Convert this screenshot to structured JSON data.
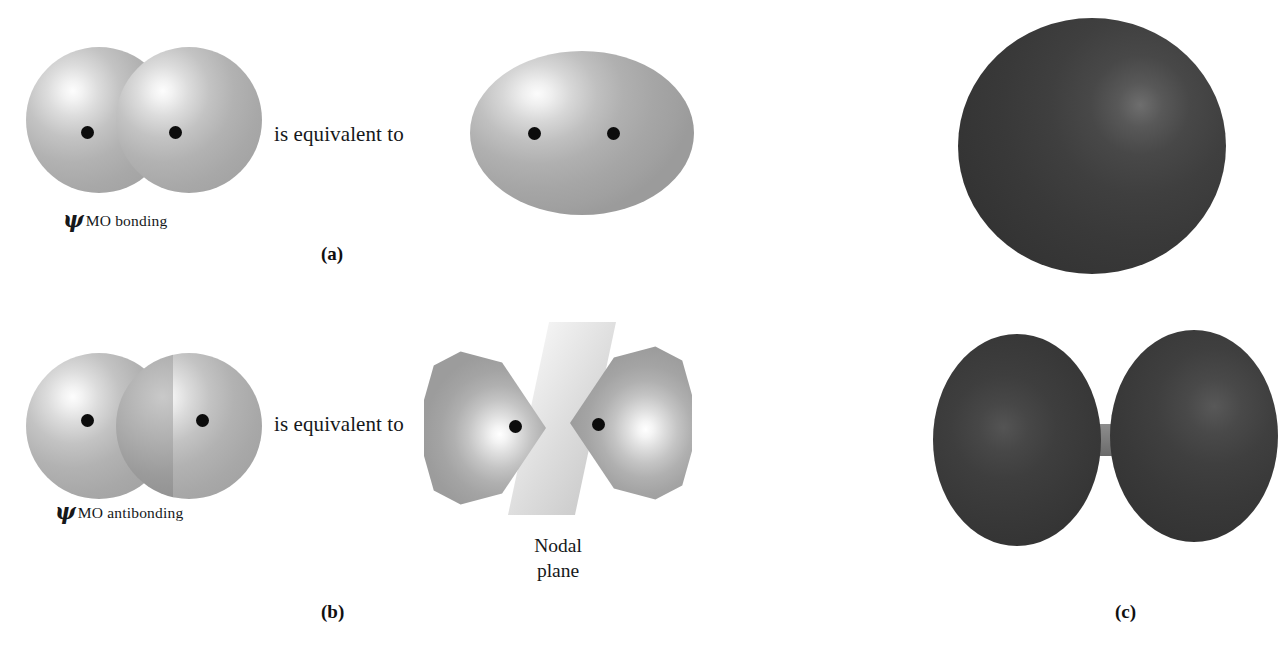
{
  "figure": {
    "background_color": "#ffffff",
    "panels": [
      {
        "id": "a",
        "letter": "(a)",
        "orbital_label_symbol": "ψ",
        "orbital_label_subscript": "MO bonding",
        "relation_text": "is equivalent to",
        "left_shape": "two-overlapping-light-spheres",
        "right_shape": "merged-ellipsoid",
        "nuclei_count": 2
      },
      {
        "id": "b",
        "letter": "(b)",
        "orbital_label_symbol": "ψ",
        "orbital_label_subscript": "MO antibonding",
        "relation_text": "is equivalent to",
        "left_shape": "two-overlapping-spheres-with-dark-lens",
        "right_shape": "two-cone-lobes-with-nodal-plane",
        "nodal_caption_line1": "Nodal",
        "nodal_caption_line2": "plane",
        "nuclei_count": 2
      },
      {
        "id": "c",
        "letter": "(c)",
        "top_shape": "dark-sphere-bonding-mo-surface",
        "bottom_shape": "dark-two-lobe-antibonding-mo-surface"
      }
    ]
  },
  "colors": {
    "sphere_light": "#b2b2b2",
    "sphere_light_highlight": "#fdfdfd",
    "overlap_lens": "#8e8e8e",
    "nodal_plane": "#dcdcdc",
    "surface_dark": "#3a3a3a",
    "surface_dark_highlight": "#6e6e6e",
    "neck": "#808080",
    "nucleus": "#0c0c0c",
    "text": "#16181a"
  },
  "labels": {
    "equivalent_a": "is equivalent to",
    "equivalent_b": "is equivalent to",
    "psi_symbol": "ψ",
    "sub_bonding": "MO bonding",
    "sub_antibonding": "MO antibonding",
    "nodal_line1": "Nodal",
    "nodal_line2": "plane",
    "letter_a": "(a)",
    "letter_b": "(b)",
    "letter_c": "(c)"
  }
}
